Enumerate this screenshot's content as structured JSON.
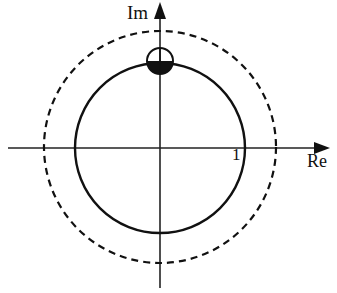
{
  "diagram": {
    "type": "complex-plane",
    "labels": {
      "imag_axis": "Im",
      "real_axis": "Re",
      "unit_mark": "1"
    },
    "colors": {
      "stroke": "#111111",
      "background": "#ffffff"
    },
    "elements": [
      {
        "name": "unit-circle",
        "style": "solid",
        "description": "Solid circle centered at origin, crossing real axis at 1"
      },
      {
        "name": "outer-circle",
        "style": "dashed",
        "description": "Larger dashed circle centered at origin"
      },
      {
        "name": "small-circle",
        "style": "half-filled",
        "description": "Small circle on imaginary axis at top of unit circle, lower half filled black"
      }
    ]
  }
}
